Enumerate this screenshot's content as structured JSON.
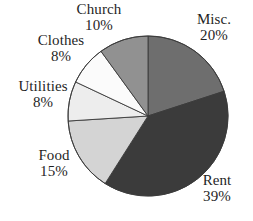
{
  "chart_data": {
    "type": "pie",
    "title": "",
    "subtitle": "",
    "xlabel": "",
    "ylabel": "",
    "legend_position": "none",
    "grid": false,
    "labels_on_slices": false,
    "start_angle_deg": 0,
    "direction": "clockwise",
    "categories": [
      "Misc.",
      "Rent",
      "Food",
      "Utilities",
      "Clothes",
      "Church"
    ],
    "values": [
      20,
      39,
      15,
      8,
      8,
      10
    ],
    "value_unit": "%",
    "total": 100,
    "slices": [
      {
        "label": "Misc.",
        "value": 20,
        "value_text": "20%",
        "color": "#6e6e6e"
      },
      {
        "label": "Rent",
        "value": 39,
        "value_text": "39%",
        "color": "#3b3b3b"
      },
      {
        "label": "Food",
        "value": 15,
        "value_text": "15%",
        "color": "#d4d4d4"
      },
      {
        "label": "Utilities",
        "value": 8,
        "value_text": "8%",
        "color": "#ededed"
      },
      {
        "label": "Clothes",
        "value": 8,
        "value_text": "8%",
        "color": "#fbfbfb"
      },
      {
        "label": "Church",
        "value": 10,
        "value_text": "10%",
        "color": "#919191"
      }
    ]
  },
  "labels": {
    "church": {
      "name": "Church",
      "value": "10%"
    },
    "misc": {
      "name": "Misc.",
      "value": "20%"
    },
    "clothes": {
      "name": "Clothes",
      "value": "8%"
    },
    "utilities": {
      "name": "Utilities",
      "value": "8%"
    },
    "food": {
      "name": "Food",
      "value": "15%"
    },
    "rent": {
      "name": "Rent",
      "value": "39%"
    }
  },
  "geometry": {
    "center_x": 148,
    "center_y": 116,
    "radius": 80
  },
  "colors": {
    "background": "#ffffff",
    "text": "#1f1f1f",
    "slice_outline": "#3a3a3a"
  }
}
